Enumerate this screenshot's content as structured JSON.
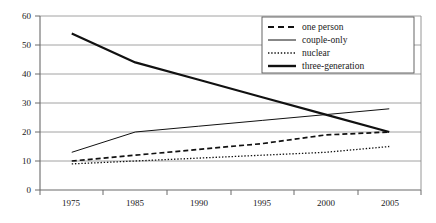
{
  "chart_data": {
    "type": "line",
    "title": "",
    "xlabel": "",
    "ylabel": "",
    "categories": [
      "1975",
      "1985",
      "1990",
      "1995",
      "2000",
      "2005"
    ],
    "ylim": [
      0,
      60
    ],
    "yticks": [
      0,
      10,
      20,
      30,
      40,
      50,
      60
    ],
    "grid": true,
    "legend_position": "top-right",
    "series": [
      {
        "name": "one person",
        "style": "dashed",
        "values": [
          10,
          12,
          14,
          16,
          19,
          20
        ]
      },
      {
        "name": "couple-only",
        "style": "solid-thin",
        "values": [
          13,
          20,
          22,
          24,
          26,
          28
        ]
      },
      {
        "name": "nuclear",
        "style": "dotted",
        "values": [
          9,
          10,
          11,
          12,
          13,
          15
        ]
      },
      {
        "name": "three-generation",
        "style": "solid-thick",
        "values": [
          54,
          44,
          38,
          32,
          26,
          20
        ]
      }
    ]
  },
  "legend": {
    "items": [
      {
        "label": "one person"
      },
      {
        "label": "couple-only"
      },
      {
        "label": "nuclear"
      },
      {
        "label": "three-generation"
      }
    ]
  },
  "yaxis": {
    "labels": [
      "60",
      "50",
      "40",
      "30",
      "20",
      "10",
      "0"
    ]
  },
  "xaxis": {
    "labels": [
      "1975",
      "1985",
      "1990",
      "1995",
      "2000",
      "2005"
    ]
  }
}
